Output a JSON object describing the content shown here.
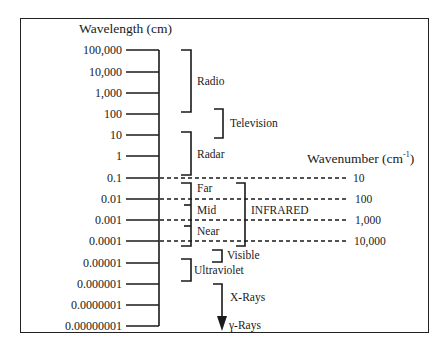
{
  "diagram": {
    "title_left": "Wavelength (cm)",
    "title_right_main": "Wavenumber (cm",
    "title_right_sup": "-1",
    "title_right_close": ")",
    "wavelength_ticks": [
      "100,000",
      "10,000",
      "1,000",
      "100",
      "10",
      "1",
      "0.1",
      "0.01",
      "0.001",
      "0.0001",
      "0.00001",
      "0.000001",
      "0.0000001",
      "0.00000001"
    ],
    "wavenumber_ticks": [
      "10",
      "100",
      "1,000",
      "10,000"
    ],
    "regions": {
      "radio": "Radio",
      "television": "Television",
      "radar": "Radar",
      "far": "Far",
      "mid": "Mid",
      "near": "Near",
      "infrared": "INFRARED",
      "visible": "Visible",
      "ultraviolet": "Ultraviolet",
      "xrays": "X-Rays",
      "gammarays": "γ-Rays"
    }
  },
  "colors": {
    "ink": "#1a1a1a",
    "background": "#ffffff"
  }
}
